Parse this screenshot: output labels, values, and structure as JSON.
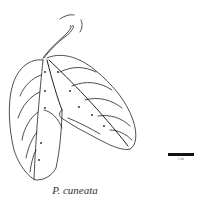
{
  "figure": {
    "species_caption": "P. cuneata",
    "scale_bar_label": "1 cm",
    "line_color": "#222222",
    "background": "#ffffff"
  }
}
